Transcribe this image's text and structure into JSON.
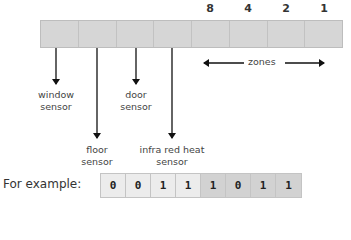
{
  "register": {
    "cells": 8,
    "weights": [
      "8",
      "4",
      "2",
      "1"
    ],
    "zones_label": "zones"
  },
  "sensors": [
    {
      "name": "window-sensor",
      "line1": "window",
      "line2": "sensor"
    },
    {
      "name": "floor-sensor",
      "line1": "floor",
      "line2": "sensor"
    },
    {
      "name": "door-sensor",
      "line1": "door",
      "line2": "sensor"
    },
    {
      "name": "infra-red-heat-sensor",
      "line1": "infra red heat",
      "line2": "sensor"
    }
  ],
  "example": {
    "label": "For example:",
    "bits": [
      "0",
      "0",
      "1",
      "1",
      "1",
      "0",
      "1",
      "1"
    ]
  },
  "colors": {
    "register_fill": "#d6d6d6",
    "example_light": "#ececec",
    "example_dark": "#d2d2d2",
    "arrow": "#111111"
  }
}
